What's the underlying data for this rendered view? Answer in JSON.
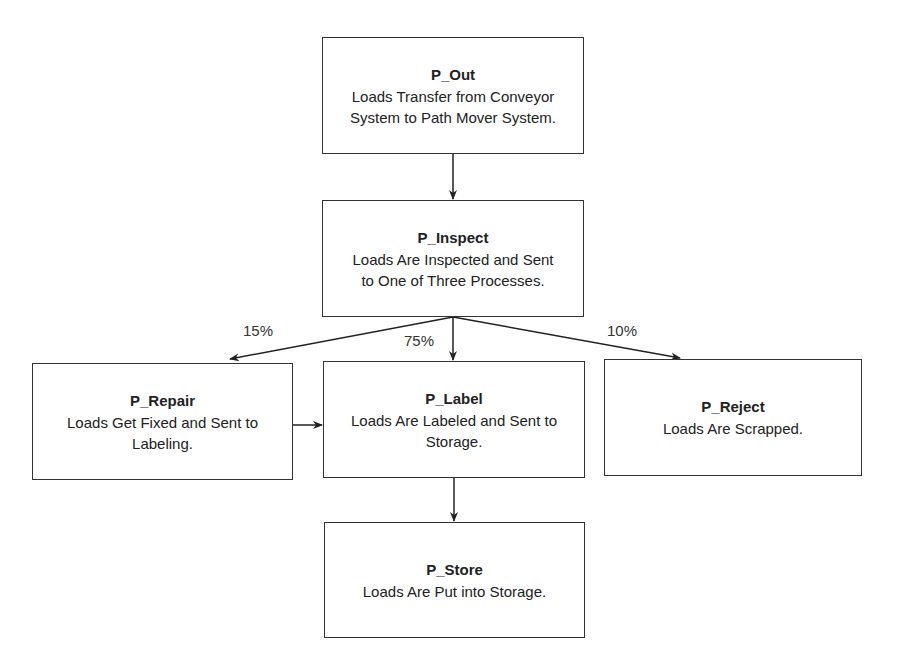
{
  "diagram": {
    "nodes": [
      {
        "id": "P_Out",
        "title": "P_Out",
        "description_lines": [
          "Loads Transfer from Conveyor",
          "System to Path Mover System."
        ]
      },
      {
        "id": "P_Inspect",
        "title": "P_Inspect",
        "description_lines": [
          "Loads Are Inspected and Sent",
          "to One of Three Processes."
        ]
      },
      {
        "id": "P_Repair",
        "title": "P_Repair",
        "description_lines": [
          "Loads Get Fixed and Sent to",
          "Labeling."
        ]
      },
      {
        "id": "P_Label",
        "title": "P_Label",
        "description_lines": [
          "Loads Are Labeled and Sent to",
          "Storage."
        ]
      },
      {
        "id": "P_Reject",
        "title": "P_Reject",
        "description_lines": [
          "Loads Are Scrapped."
        ]
      },
      {
        "id": "P_Store",
        "title": "P_Store",
        "description_lines": [
          "Loads Are Put into Storage."
        ]
      }
    ],
    "edges": [
      {
        "from": "P_Out",
        "to": "P_Inspect",
        "label": ""
      },
      {
        "from": "P_Inspect",
        "to": "P_Repair",
        "label": "15%"
      },
      {
        "from": "P_Inspect",
        "to": "P_Label",
        "label": "75%"
      },
      {
        "from": "P_Inspect",
        "to": "P_Reject",
        "label": "10%"
      },
      {
        "from": "P_Repair",
        "to": "P_Label",
        "label": ""
      },
      {
        "from": "P_Label",
        "to": "P_Store",
        "label": ""
      }
    ]
  }
}
